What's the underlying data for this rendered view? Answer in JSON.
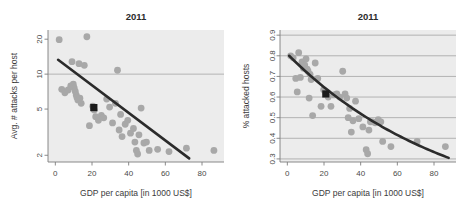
{
  "figure": {
    "panel_count": 2,
    "background_color": "#ffffff",
    "plot_background_color": "#ececec",
    "point_color": "#a8a8a8",
    "highlight_color": "#1a1a1a",
    "trend_color": "#2b2b2b",
    "grid_color": "#9a9a9a"
  },
  "chart_data": [
    {
      "type": "scatter",
      "panel": "left",
      "title": "2011",
      "xlabel": "GDP per capita [in 1000 US$]",
      "ylabel": "Avg. # attacks per host",
      "xlim": [
        -4,
        92
      ],
      "xticks": [
        0,
        20,
        40,
        60,
        80
      ],
      "xticklabels": [
        "0",
        "20",
        "40",
        "60",
        "80"
      ],
      "yscale": "log",
      "ylim": [
        1.75,
        24
      ],
      "yticks": [
        2,
        5,
        10,
        20
      ],
      "yticklabels": [
        "2",
        "5",
        "10",
        "20"
      ],
      "gridlines_y": [
        10
      ],
      "grid": true,
      "legend": "none",
      "x": [
        2.1,
        3.5,
        5.2,
        7.0,
        8.4,
        9.1,
        9.8,
        10.3,
        10.9,
        11.4,
        11.8,
        12.3,
        12.9,
        13.4,
        14.1,
        15.8,
        17.2,
        18.6,
        20.4,
        21.2,
        22.0,
        23.5,
        25.1,
        26.4,
        28.0,
        29.6,
        31.2,
        32.8,
        33.9,
        34.8,
        35.6,
        36.4,
        38.1,
        39.5,
        41.0,
        42.6,
        43.4,
        44.2,
        44.9,
        45.6,
        46.8,
        48.3,
        49.7,
        51.2,
        55.8,
        62.0,
        71.5,
        86.5
      ],
      "y": [
        19.8,
        7.4,
        6.9,
        7.3,
        7.9,
        12.8,
        8.2,
        7.6,
        7.1,
        6.6,
        6.3,
        6.0,
        12.3,
        6.2,
        5.6,
        11.9,
        21.0,
        3.6,
        5.3,
        4.9,
        4.3,
        4.0,
        4.4,
        4.2,
        6.1,
        5.2,
        3.8,
        5.6,
        10.8,
        3.3,
        4.5,
        2.9,
        3.7,
        4.0,
        3.1,
        3.4,
        2.6,
        2.2,
        2.05,
        3.0,
        5.1,
        2.55,
        2.6,
        2.2,
        2.25,
        2.15,
        2.3,
        2.2
      ],
      "highlight_point": {
        "x": 21.0,
        "y": 5.15,
        "marker": "square"
      },
      "trend": {
        "kind": "log-linear",
        "x_start": 1.5,
        "x_end": 73.0,
        "y_start": 13.3,
        "y_end": 1.88
      }
    },
    {
      "type": "scatter",
      "panel": "right",
      "title": "2011",
      "xlabel": "GDP per capita [in 1000 US$]",
      "ylabel": "% attacked hosts",
      "xlim": [
        -4,
        92
      ],
      "xticks": [
        0,
        20,
        40,
        60,
        80
      ],
      "xticklabels": [
        "0",
        "20",
        "40",
        "60",
        "80"
      ],
      "yscale": "linear",
      "ylim": [
        0.285,
        0.925
      ],
      "yticks": [
        0.3,
        0.4,
        0.5,
        0.6,
        0.7,
        0.8,
        0.9
      ],
      "yticklabels": [
        "0.3",
        "0.4",
        "0.5",
        "0.6",
        "0.7",
        "0.8",
        "0.9"
      ],
      "gridlines_y": [
        0.3,
        0.4,
        0.5,
        0.6,
        0.7,
        0.8,
        0.9
      ],
      "grid": true,
      "legend": "none",
      "x": [
        1.8,
        3.2,
        4.6,
        5.4,
        6.2,
        7.1,
        8.0,
        8.8,
        9.5,
        10.2,
        10.8,
        11.3,
        11.9,
        12.4,
        13.0,
        13.8,
        15.2,
        16.6,
        18.4,
        19.8,
        21.0,
        22.3,
        23.8,
        25.4,
        27.0,
        28.6,
        30.2,
        31.5,
        32.4,
        33.2,
        34.0,
        34.9,
        35.8,
        37.2,
        39.0,
        41.2,
        43.0,
        43.8,
        44.5,
        45.3,
        46.5,
        48.0,
        49.6,
        51.0,
        52.0,
        56.5,
        70.8,
        86.2
      ],
      "y": [
        0.8,
        0.79,
        0.69,
        0.625,
        0.815,
        0.695,
        0.77,
        0.74,
        0.755,
        0.785,
        0.735,
        0.725,
        0.595,
        0.71,
        0.685,
        0.51,
        0.765,
        0.69,
        0.555,
        0.635,
        0.62,
        0.6,
        0.555,
        0.61,
        0.615,
        0.6,
        0.725,
        0.615,
        0.595,
        0.5,
        0.545,
        0.43,
        0.485,
        0.58,
        0.495,
        0.455,
        0.345,
        0.325,
        0.44,
        0.48,
        0.48,
        0.475,
        0.49,
        0.48,
        0.385,
        0.36,
        0.385,
        0.36
      ],
      "highlight_point": {
        "x": 21.0,
        "y": 0.615,
        "marker": "square"
      },
      "trend": {
        "kind": "exponential-decay",
        "x_start": 1.0,
        "x_end": 88.0,
        "y_start": 0.8,
        "y_end": 0.305,
        "curvature": 0.62
      }
    }
  ]
}
